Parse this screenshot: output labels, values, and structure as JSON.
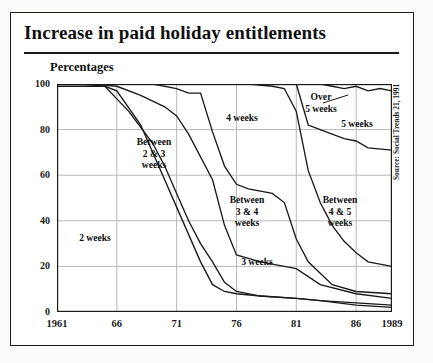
{
  "title": "Increase in paid holiday entitlements",
  "axis_title": "Percentages",
  "source": "Source: Social Trends 21, 1991",
  "chart_data": {
    "type": "area",
    "title": "Increase in paid holiday entitlements",
    "subtitle": "Percentages",
    "xlabel": "",
    "ylabel": "Percentages",
    "xlim": [
      1961,
      1989
    ],
    "ylim": [
      0,
      100
    ],
    "grid": true,
    "legend_position": "inline-labels",
    "source": "Source: Social Trends 21, 1991",
    "x_ticks": [
      "1961",
      "66",
      "71",
      "76",
      "81",
      "86",
      "1989"
    ],
    "x_tick_values": [
      1961,
      1966,
      1971,
      1976,
      1981,
      1986,
      1989
    ],
    "y_ticks": [
      "0",
      "20",
      "40",
      "60",
      "80",
      "100"
    ],
    "y_tick_values": [
      0,
      20,
      40,
      60,
      80,
      100
    ],
    "band_labels": [
      "2 weeks",
      "Between\n2 & 3\nweeks",
      "3 weeks",
      "Between\n3 & 4\nweeks",
      "4 weeks",
      "Between\n4 & 5\nweeks",
      "5 weeks",
      "Over\n5 weeks"
    ],
    "series": [
      {
        "name": "2 weeks",
        "boundary": "top of 2 weeks band",
        "x": [
          1961,
          1965,
          1966,
          1968,
          1969,
          1970,
          1971,
          1973,
          1974,
          1975,
          1976,
          1978,
          1981,
          1983,
          1986,
          1989
        ],
        "values": [
          99,
          99,
          97,
          82,
          70,
          58,
          46,
          22,
          12,
          9,
          8,
          7,
          6,
          5,
          3,
          2
        ]
      },
      {
        "name": "Between 2 & 3 weeks",
        "boundary": "top of between 2 & 3 weeks band",
        "x": [
          1961,
          1963,
          1965,
          1967,
          1969,
          1970,
          1971,
          1972,
          1973,
          1974,
          1975,
          1976,
          1978,
          1981,
          1983,
          1986,
          1989
        ],
        "values": [
          100,
          100,
          99,
          88,
          74,
          64,
          52,
          40,
          30,
          22,
          13,
          9,
          7,
          6,
          5,
          4,
          3
        ]
      },
      {
        "name": "3 weeks",
        "boundary": "top of 3 weeks band",
        "x": [
          1961,
          1964,
          1966,
          1968,
          1970,
          1971,
          1972,
          1974,
          1975,
          1976,
          1978,
          1979,
          1980,
          1981,
          1983,
          1986,
          1989
        ],
        "values": [
          100,
          100,
          99,
          95,
          90,
          86,
          78,
          58,
          38,
          25,
          22,
          21,
          20,
          19,
          12,
          8,
          6
        ]
      },
      {
        "name": "Between 3 & 4 weeks",
        "boundary": "top of between 3 & 4 weeks band",
        "x": [
          1961,
          1966,
          1969,
          1971,
          1972,
          1973,
          1974,
          1975,
          1976,
          1977,
          1979,
          1980,
          1981,
          1982,
          1984,
          1986,
          1989
        ],
        "values": [
          100,
          100,
          100,
          98,
          96,
          96,
          79,
          64,
          56,
          54,
          52,
          48,
          32,
          22,
          12,
          9,
          8
        ]
      },
      {
        "name": "4 weeks",
        "boundary": "top of 4 weeks band",
        "x": [
          1961,
          1971,
          1974,
          1977,
          1979,
          1980,
          1981,
          1982,
          1983,
          1984,
          1985,
          1986,
          1987,
          1989
        ],
        "values": [
          100,
          100,
          100,
          100,
          99,
          98,
          88,
          62,
          48,
          38,
          31,
          26,
          22,
          20
        ]
      },
      {
        "name": "Between 4 & 5 weeks",
        "boundary": "top of between 4 & 5 weeks band",
        "x": [
          1961,
          1979,
          1981,
          1982,
          1983,
          1984,
          1985,
          1986,
          1987,
          1989
        ],
        "values": [
          100,
          100,
          100,
          82,
          80,
          78,
          76,
          75,
          72,
          71
        ]
      },
      {
        "name": "5 weeks",
        "boundary": "top of 5 weeks band",
        "x": [
          1961,
          1981,
          1982,
          1983,
          1984,
          1985,
          1986,
          1987,
          1988,
          1989
        ],
        "values": [
          100,
          100,
          100,
          100,
          99,
          98,
          99,
          97,
          98,
          97
        ]
      }
    ]
  }
}
